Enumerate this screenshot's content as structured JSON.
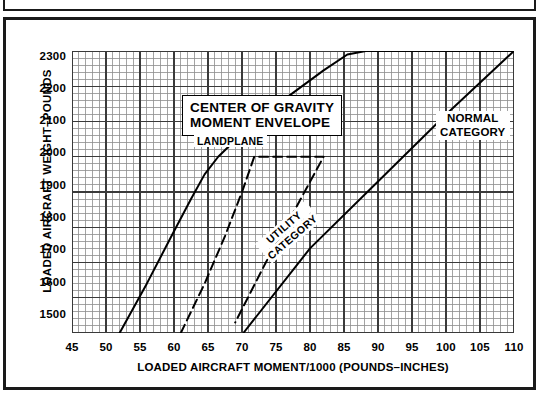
{
  "top_strip": {
    "caption": ""
  },
  "chart_data": {
    "type": "line",
    "title": "CENTER OF GRAVITY MOMENT ENVELOPE",
    "subtitle": "LANDPLANE",
    "xlabel": "LOADED AIRCRAFT MOMENT/1000 (POUNDS–INCHES)",
    "ylabel": "LOADED AIRCRAFT WEIGHT–POUNDS",
    "xlim": [
      45,
      110
    ],
    "ylim": [
      1500,
      2300
    ],
    "xticks": [
      45,
      50,
      55,
      60,
      65,
      70,
      75,
      80,
      85,
      90,
      95,
      100,
      105,
      110
    ],
    "yticks": [
      1500,
      1600,
      1700,
      1800,
      1900,
      2000,
      2100,
      2200,
      2300
    ],
    "grid": true,
    "grid_minor_step_x": 1,
    "grid_major_step_x": 5,
    "grid_minor_step_y": 20,
    "grid_major_step_y": 100,
    "grid_color": "#8d8d8d",
    "grid_major_color": "#3a3a3a",
    "legend": "in-plot-annotations",
    "annotations": [
      {
        "label": "NORMAL CATEGORY",
        "x": 90,
        "y": 2245
      },
      {
        "label": "UTILITY CATEGORY",
        "x": 71,
        "y": 1800,
        "rotation": -41
      }
    ],
    "series": [
      {
        "name": "NORMAL CATEGORY",
        "style": "solid",
        "color": "#000000",
        "points": [
          [
            52.0,
            1500
          ],
          [
            56.0,
            1640
          ],
          [
            59.5,
            1770
          ],
          [
            62.5,
            1880
          ],
          [
            64.5,
            1950
          ],
          [
            66.5,
            2000
          ],
          [
            70.5,
            2075
          ],
          [
            76.0,
            2160
          ],
          [
            82.0,
            2245
          ],
          [
            85.5,
            2290
          ],
          [
            88.2,
            2300
          ],
          [
            110.0,
            2300
          ],
          [
            110.0,
            2300
          ],
          [
            100.0,
            2120
          ],
          [
            90.0,
            1930
          ],
          [
            80.0,
            1740
          ],
          [
            70.2,
            1500
          ]
        ]
      },
      {
        "name": "UTILITY CATEGORY",
        "style": "dashed",
        "color": "#000000",
        "points": [
          [
            61.0,
            1500
          ],
          [
            64.5,
            1640
          ],
          [
            67.5,
            1775
          ],
          [
            70.0,
            1900
          ],
          [
            71.8,
            2000
          ],
          [
            82.0,
            2000
          ],
          [
            82.0,
            2000
          ],
          [
            77.5,
            1840
          ],
          [
            73.5,
            1700
          ],
          [
            70.2,
            1575
          ],
          [
            69.0,
            1530
          ]
        ]
      }
    ]
  }
}
